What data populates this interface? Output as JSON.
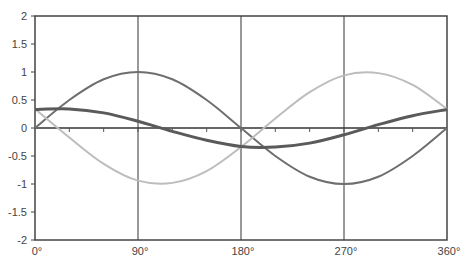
{
  "chart_data": {
    "type": "line",
    "title": "",
    "xlabel": "",
    "ylabel": "",
    "xlim": [
      0,
      360
    ],
    "ylim": [
      -2,
      2
    ],
    "x_ticks": [
      0,
      90,
      180,
      270,
      360
    ],
    "x_tick_labels": [
      "0°",
      "90°",
      "180°",
      "270°",
      "360°"
    ],
    "y_ticks": [
      2,
      1.5,
      1,
      0.5,
      0,
      -0.5,
      -1,
      -1.5,
      -2
    ],
    "y_tick_labels": [
      "2",
      "1.5",
      "1",
      "0.5",
      "0",
      "-0.5",
      "-1",
      "-1.5",
      "-2"
    ],
    "grid": "vertical lines at 90°, 180°, 270°",
    "legend": "none",
    "x": [
      0,
      30,
      60,
      90,
      120,
      150,
      180,
      210,
      240,
      270,
      300,
      330,
      360
    ],
    "series": [
      {
        "name": "sin",
        "color": "#6e6e6e",
        "width": 2,
        "values": [
          0,
          0.5,
          0.87,
          1,
          0.87,
          0.5,
          0,
          -0.5,
          -0.87,
          -1,
          -0.87,
          -0.5,
          0
        ]
      },
      {
        "name": "phase-shifted",
        "color": "#bdbdbd",
        "width": 2,
        "values": [
          0.34,
          -0.17,
          -0.64,
          -0.94,
          -0.98,
          -0.77,
          -0.34,
          0.17,
          0.64,
          0.94,
          0.98,
          0.77,
          0.34
        ]
      },
      {
        "name": "small-amplitude",
        "color": "#5a5a5a",
        "width": 3,
        "values": [
          0.33,
          0.34,
          0.27,
          0.12,
          -0.06,
          -0.22,
          -0.33,
          -0.34,
          -0.27,
          -0.12,
          0.06,
          0.22,
          0.33
        ]
      }
    ]
  }
}
